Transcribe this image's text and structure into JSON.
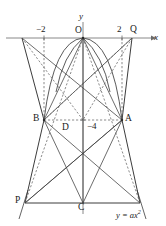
{
  "figure": {
    "type": "geometry-diagram",
    "width": 166,
    "height": 226,
    "colors": {
      "stroke": "#3c3c3c",
      "axis": "#6b6b6b",
      "dashed": "#5a5a5a",
      "text": "#1a1a1a",
      "background": "#ffffff"
    }
  },
  "axes": {
    "x_label": "x",
    "y_label": "y",
    "origin_label": "O",
    "x_axis_y": 38,
    "y_axis_x": 83
  },
  "ticks": {
    "x_negative_two": "−2",
    "x_two": "2",
    "y_negative_four": "−4"
  },
  "points": {
    "O": {
      "label": "O",
      "x": 83,
      "y": 38
    },
    "Q": {
      "label": "Q",
      "x": 132,
      "y": 38
    },
    "A": {
      "label": "A",
      "x": 122,
      "y": 120
    },
    "B": {
      "label": "B",
      "x": 44,
      "y": 120
    },
    "C": {
      "label": "C",
      "x": 83,
      "y": 203
    },
    "D": {
      "label": "D",
      "x": 66,
      "y": 127
    },
    "P": {
      "label": "P",
      "x": 25,
      "y": 203
    }
  },
  "curve": {
    "equation": "y = ax",
    "exponent": "2",
    "full_equation": "y = ax²"
  },
  "geometry": {
    "x_tick_left": 44,
    "x_tick_right": 122,
    "left_top": 22,
    "right_top": 132,
    "bottom_left": 25,
    "bottom_right": 140
  }
}
